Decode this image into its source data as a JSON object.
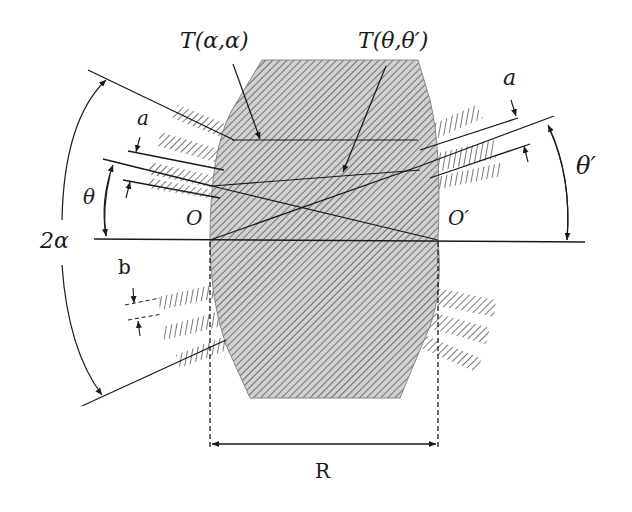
{
  "diagram": {
    "type": "schematic",
    "labels": {
      "t_alpha_alpha": "T(α,α)",
      "t_theta_thetaprime": "T(θ,θ′)",
      "a_left": "a",
      "a_right": "a",
      "theta": "θ",
      "theta_prime": "θ′",
      "two_alpha": "2α",
      "origin_left": "O",
      "origin_right": "O′",
      "b": "b",
      "radius": "R"
    },
    "colors": {
      "line": "#1a1a1a",
      "hatch": "#555555",
      "body_fill": "#c8c8c8",
      "background": "#ffffff"
    }
  }
}
